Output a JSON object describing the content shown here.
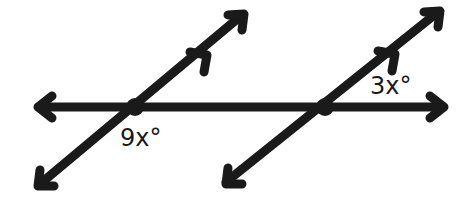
{
  "diagram": {
    "type": "parallel-lines-cut-by-transversal",
    "stroke_color": "#1a1a1a",
    "background": "#ffffff",
    "lines": [
      {
        "name": "horizontal-transversal",
        "from": [
          35,
          107
        ],
        "to": [
          447,
          107
        ],
        "arrows": "both"
      },
      {
        "name": "left-parallel-line",
        "from": [
          37,
          188
        ],
        "to": [
          246,
          12
        ],
        "arrows": "both",
        "parallel_mark": true
      },
      {
        "name": "right-parallel-line",
        "from": [
          223,
          186
        ],
        "to": [
          442,
          9
        ],
        "arrows": "both",
        "parallel_mark": true
      }
    ],
    "intersections": [
      {
        "name": "left-intersection",
        "point": [
          135,
          107
        ]
      },
      {
        "name": "right-intersection",
        "point": [
          325,
          107
        ]
      }
    ],
    "labels": {
      "left_angle": "9x°",
      "right_angle": "3x°"
    }
  }
}
